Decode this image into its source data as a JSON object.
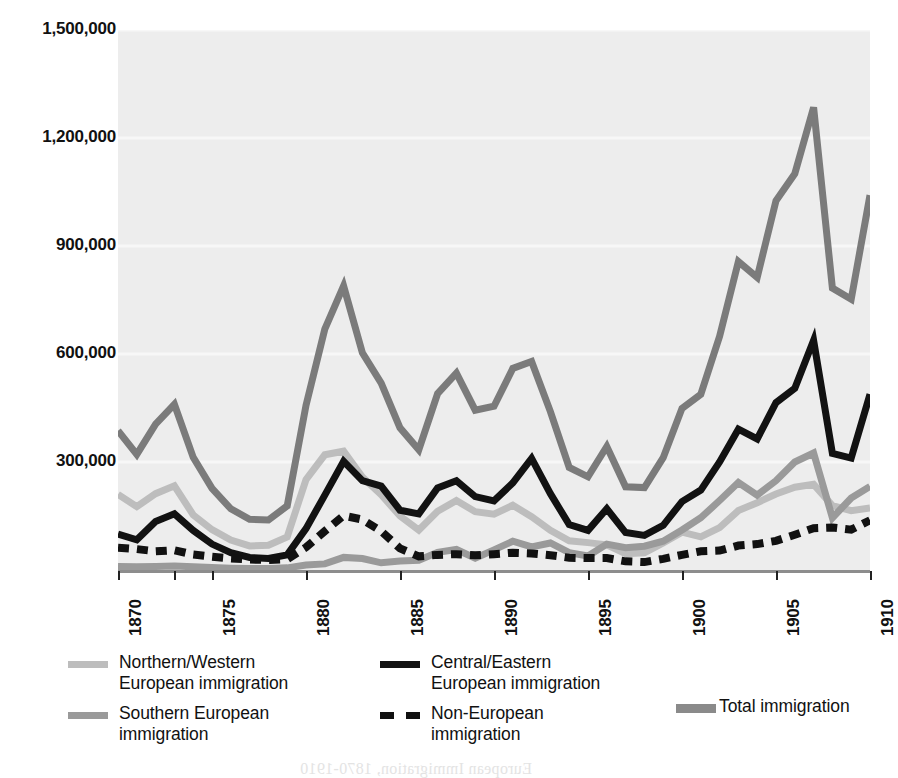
{
  "chart_data": {
    "type": "line",
    "title": "",
    "subtitle": "",
    "xlabel": "",
    "ylabel": "",
    "xlim": [
      1870,
      1910
    ],
    "ylim": [
      0,
      1500000
    ],
    "grid": true,
    "grid_color": "#f7f7f7",
    "plot_background": "#ededed",
    "legend_position": "below",
    "y_ticks": [
      {
        "value": 1500000,
        "label": "1,500,000"
      },
      {
        "value": 1200000,
        "label": "1,200,000"
      },
      {
        "value": 900000,
        "label": "900,000"
      },
      {
        "value": 600000,
        "label": "600,000"
      },
      {
        "value": 300000,
        "label": "300,000"
      }
    ],
    "x_ticks": [
      {
        "value": 1870,
        "label": "1870"
      },
      {
        "value": 1873,
        "label": ""
      },
      {
        "value": 1875,
        "label": "1875"
      },
      {
        "value": 1880,
        "label": "1880"
      },
      {
        "value": 1885,
        "label": "1885"
      },
      {
        "value": 1890,
        "label": "1890"
      },
      {
        "value": 1895,
        "label": "1895"
      },
      {
        "value": 1900,
        "label": "1900"
      },
      {
        "value": 1905,
        "label": "1905"
      },
      {
        "value": 1910,
        "label": "1910"
      }
    ],
    "x": [
      1870,
      1871,
      1872,
      1873,
      1874,
      1875,
      1876,
      1877,
      1878,
      1879,
      1880,
      1881,
      1882,
      1883,
      1884,
      1885,
      1886,
      1887,
      1888,
      1889,
      1890,
      1891,
      1892,
      1893,
      1894,
      1895,
      1896,
      1897,
      1898,
      1899,
      1900,
      1901,
      1902,
      1903,
      1904,
      1905,
      1906,
      1907,
      1908,
      1909,
      1910
    ],
    "series": [
      {
        "name": "Total immigration",
        "key": "total",
        "color": "#7b7b7b",
        "style": "solid",
        "width": 7,
        "values": [
          387000,
          321000,
          405000,
          460000,
          313000,
          227000,
          170000,
          141000,
          139000,
          178000,
          457000,
          669000,
          789000,
          603000,
          519000,
          395000,
          334000,
          490000,
          547000,
          444000,
          455000,
          560000,
          579000,
          440000,
          285000,
          259000,
          343000,
          231000,
          229000,
          312000,
          449000,
          488000,
          649000,
          857000,
          813000,
          1026000,
          1101000,
          1285000,
          783000,
          752000,
          1041000
        ]
      },
      {
        "name": "Central/Eastern European immigration",
        "key": "central_eastern",
        "color": "#121212",
        "style": "solid",
        "width": 7,
        "values": [
          100000,
          84000,
          135000,
          156000,
          110000,
          72000,
          48000,
          35000,
          32000,
          42000,
          115000,
          208000,
          302000,
          248000,
          233000,
          166000,
          156000,
          228000,
          248000,
          204000,
          192000,
          242000,
          310000,
          212000,
          126000,
          110000,
          170000,
          104000,
          96000,
          124000,
          190000,
          222000,
          300000,
          391000,
          364000,
          465000,
          505000,
          638000,
          324000,
          311000,
          488000
        ]
      },
      {
        "name": "Southern European immigration",
        "key": "southern",
        "color": "#9a9a9a",
        "style": "solid",
        "width": 7,
        "values": [
          10000,
          9000,
          10000,
          11000,
          9000,
          7000,
          5000,
          4000,
          4000,
          6000,
          14000,
          17000,
          35000,
          32000,
          20000,
          25000,
          27000,
          49000,
          57000,
          33000,
          56000,
          80000,
          64000,
          75000,
          48000,
          39000,
          72000,
          62000,
          66000,
          80000,
          111000,
          145000,
          193000,
          243000,
          208000,
          248000,
          300000,
          325000,
          145000,
          200000,
          232000
        ]
      },
      {
        "name": "Northern/Western European immigration",
        "key": "northern_western",
        "color": "#bdbdbd",
        "style": "solid",
        "width": 7,
        "values": [
          210000,
          176000,
          212000,
          234000,
          153000,
          112000,
          83000,
          67000,
          69000,
          92000,
          251000,
          320000,
          330000,
          258000,
          209000,
          150000,
          111000,
          163000,
          193000,
          162000,
          155000,
          180000,
          148000,
          110000,
          81000,
          76000,
          70000,
          45000,
          48000,
          75000,
          105000,
          92000,
          118000,
          165000,
          187000,
          211000,
          230000,
          238000,
          179000,
          165000,
          172000
        ]
      },
      {
        "name": "Non-European immigration",
        "key": "non_european",
        "color": "#111111",
        "style": "dashed",
        "width": 8,
        "values": [
          62000,
          58000,
          52000,
          55000,
          43000,
          37000,
          32000,
          29000,
          28000,
          30000,
          63000,
          108000,
          151000,
          140000,
          108000,
          60000,
          38000,
          42000,
          44000,
          41000,
          44000,
          48000,
          46000,
          41000,
          34000,
          33000,
          33000,
          24000,
          22000,
          31000,
          42000,
          52000,
          54000,
          68000,
          72000,
          81000,
          98000,
          116000,
          118000,
          112000,
          138000
        ]
      }
    ]
  },
  "legend": {
    "items": [
      {
        "id": "northern-western",
        "label": "Northern/Western\nEuropean immigration",
        "color": "#bdbdbd",
        "style": "solid"
      },
      {
        "id": "southern",
        "label": "Southern European\nimmigration",
        "color": "#9a9a9a",
        "style": "solid"
      },
      {
        "id": "central-eastern",
        "label": "Central/Eastern\nEuropean immigration",
        "color": "#121212",
        "style": "solid"
      },
      {
        "id": "non-european",
        "label": "Non-European\nimmigration",
        "color": "#111111",
        "style": "dashed"
      },
      {
        "id": "total",
        "label": "Total immigration",
        "color": "#8a8a8a",
        "style": "solid"
      }
    ]
  },
  "page_bleed_through": {
    "lines": [
      "mostly agricultural regions. After the turn of the cen-",
      "tury, those that came before 1880 were greatly out-",
      "numbered by immigrants from Southern and Eastern",
      "Europe — Italy, Greece, Poland, Russia, and",
      "Austria-Hungary."
    ],
    "faint_note": "European Immigration, 1870-1910"
  }
}
